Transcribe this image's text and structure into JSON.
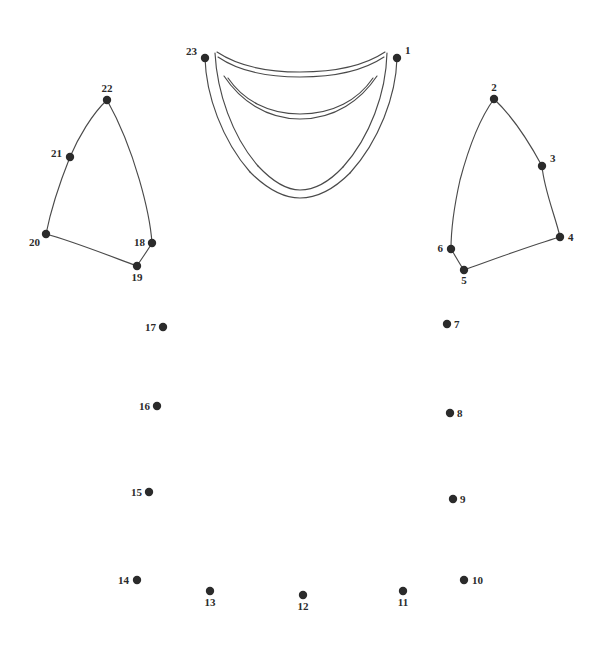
{
  "page": {
    "background_color": "#ffffff",
    "ink_color": "#2b2b2b",
    "line_color": "#4a4a4a",
    "width": 600,
    "height": 650
  },
  "dots": [
    {
      "number": "1",
      "x": 397,
      "y": 58,
      "label_dx": 8,
      "label_dy": -4,
      "anchor": "start"
    },
    {
      "number": "2",
      "x": 494,
      "y": 99,
      "label_dx": 0,
      "label_dy": -8,
      "anchor": "middle"
    },
    {
      "number": "3",
      "x": 542,
      "y": 166,
      "label_dx": 8,
      "label_dy": -4,
      "anchor": "start"
    },
    {
      "number": "4",
      "x": 560,
      "y": 237,
      "label_dx": 8,
      "label_dy": 4,
      "anchor": "start"
    },
    {
      "number": "5",
      "x": 464,
      "y": 270,
      "label_dx": 0,
      "label_dy": 14,
      "anchor": "middle"
    },
    {
      "number": "6",
      "x": 451,
      "y": 249,
      "label_dx": -8,
      "label_dy": 3,
      "anchor": "end"
    },
    {
      "number": "7",
      "x": 447,
      "y": 324,
      "label_dx": 7,
      "label_dy": 4,
      "anchor": "start"
    },
    {
      "number": "8",
      "x": 450,
      "y": 413,
      "label_dx": 7,
      "label_dy": 4,
      "anchor": "start"
    },
    {
      "number": "9",
      "x": 453,
      "y": 499,
      "label_dx": 7,
      "label_dy": 4,
      "anchor": "start"
    },
    {
      "number": "10",
      "x": 464,
      "y": 580,
      "label_dx": 8,
      "label_dy": 4,
      "anchor": "start"
    },
    {
      "number": "11",
      "x": 403,
      "y": 591,
      "label_dx": 0,
      "label_dy": 15,
      "anchor": "middle"
    },
    {
      "number": "12",
      "x": 303,
      "y": 595,
      "label_dx": 0,
      "label_dy": 15,
      "anchor": "middle"
    },
    {
      "number": "13",
      "x": 210,
      "y": 591,
      "label_dx": 0,
      "label_dy": 15,
      "anchor": "middle"
    },
    {
      "number": "14",
      "x": 137,
      "y": 580,
      "label_dx": -8,
      "label_dy": 4,
      "anchor": "end"
    },
    {
      "number": "15",
      "x": 149,
      "y": 492,
      "label_dx": -7,
      "label_dy": 4,
      "anchor": "end"
    },
    {
      "number": "16",
      "x": 157,
      "y": 406,
      "label_dx": -7,
      "label_dy": 4,
      "anchor": "end"
    },
    {
      "number": "17",
      "x": 163,
      "y": 327,
      "label_dx": -7,
      "label_dy": 4,
      "anchor": "end"
    },
    {
      "number": "18",
      "x": 152,
      "y": 243,
      "label_dx": -7,
      "label_dy": 3,
      "anchor": "end"
    },
    {
      "number": "19",
      "x": 137,
      "y": 266,
      "label_dx": 0,
      "label_dy": 15,
      "anchor": "middle"
    },
    {
      "number": "20",
      "x": 46,
      "y": 234,
      "label_dx": -6,
      "label_dy": 12,
      "anchor": "end"
    },
    {
      "number": "21",
      "x": 70,
      "y": 157,
      "label_dx": -8,
      "label_dy": 0,
      "anchor": "end"
    },
    {
      "number": "22",
      "x": 107,
      "y": 100,
      "label_dx": 0,
      "label_dy": -8,
      "anchor": "middle"
    },
    {
      "number": "23",
      "x": 205,
      "y": 58,
      "label_dx": -8,
      "label_dy": -3,
      "anchor": "end"
    }
  ],
  "drawn_paths": {
    "left_sleeve": "M 107 100 C 92 114 78 138 70 157 C 60 182 50 214 46 234 C 72 241 110 256 137 266 C 142 258 148 250 152 243 C 150 214 135 150 107 100 Z",
    "right_sleeve": "M 494 99 C 480 118 468 150 460 180 C 454 207 451 234 451 249 C 455 255 460 265 464 270 C 492 260 532 245 560 237 C 556 218 544 190 542 166 C 528 140 510 114 494 99 Z",
    "collar_outer_left": "M 205 58 C 206 95 222 140 250 172",
    "collar_outer_right": "M 397 58 C 396 96 379 141 350 173",
    "collar_outer_bottom": "M 250 172 C 268 190 285 198 300 198 C 316 198 333 190 350 173",
    "collar_inner_left": "M 215 53 C 217 92 232 136 258 166",
    "collar_inner_right": "M 387 53 C 386 93 370 137 343 167",
    "collar_inner_bottom": "M 258 166 C 274 183 288 190 300 190 C 313 190 328 183 343 167",
    "collar_band_top": "M 217 52 C 232 62 258 72 300 72 C 343 72 370 62 385 52",
    "collar_band_top2": "M 218 57 C 234 68 260 77 300 77 C 342 77 369 67 384 57",
    "collar_band_mid": "M 228 78 C 243 100 268 114 300 114 C 333 114 358 100 373 78",
    "collar_band_mid2": "M 224 76 C 240 100 266 119 300 119 C 335 119 361 100 377 76"
  }
}
